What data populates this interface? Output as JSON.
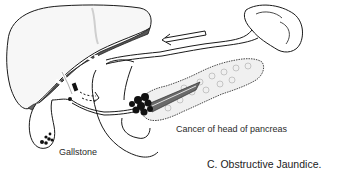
{
  "figure": {
    "caption": "C. Obstructive Jaundice.",
    "labels": {
      "gallstone": "Gallstone",
      "cancer": "Cancer of head of pancreas"
    },
    "structures": [
      "liver",
      "gallbladder",
      "gallstones",
      "common-bile-duct",
      "hepatic-ducts",
      "bile-flow-arrow",
      "pancreas",
      "pancreatic-tumor",
      "pancreatic-duct",
      "spleen",
      "splenic-vessels",
      "duodenum",
      "flow-arrow"
    ],
    "colors": {
      "ink": "#1a1a1a",
      "liver_shadow": "#555555",
      "tumor": "#111111",
      "duct_shading": "#6a6a6a",
      "paper": "#ffffff"
    }
  }
}
